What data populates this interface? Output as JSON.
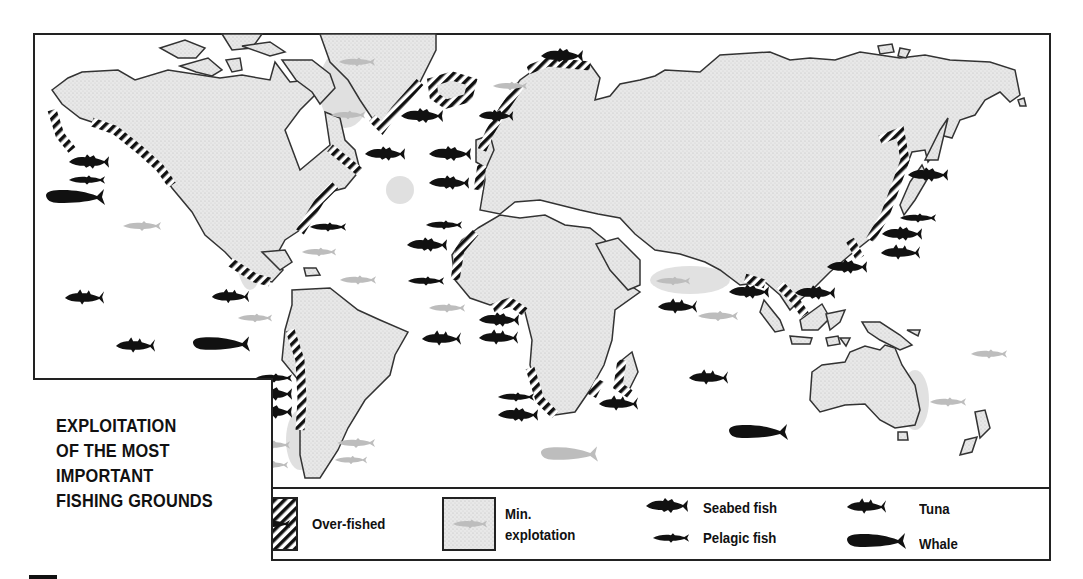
{
  "title": {
    "lines": [
      "EXPLOITATION",
      "OF THE MOST",
      "IMPORTANT",
      "FISHING GROUNDS"
    ]
  },
  "legend": {
    "overfished": {
      "label": "Over-fished",
      "pattern": "diagonal-hatch",
      "color": "#111111"
    },
    "min_exploitation": {
      "label_line1": "Min.",
      "label_line2": "explotation",
      "fill": "#e2e2e2"
    },
    "seabed_fish": {
      "label": "Seabed fish",
      "icon": "seabed-fish-icon"
    },
    "pelagic_fish": {
      "label": "Pelagic fish",
      "icon": "pelagic-fish-icon"
    },
    "tuna": {
      "label": "Tuna",
      "icon": "tuna-icon"
    },
    "whale": {
      "label": "Whale",
      "icon": "whale-icon"
    }
  },
  "colors": {
    "land": "#e6e6e6",
    "outline": "#333333",
    "overfished_hatch": "#111111",
    "exploited_fish": "#111111",
    "min_exploited_fish": "#bdbdbd",
    "min_zone_halo": "#d6d6d6"
  },
  "markers": [
    {
      "type": "seabed",
      "x": 540,
      "y": 56,
      "w": 44,
      "state": "exploited"
    },
    {
      "type": "pelagic",
      "x": 338,
      "y": 62,
      "w": 38,
      "state": "min"
    },
    {
      "type": "pelagic",
      "x": 330,
      "y": 115,
      "w": 36,
      "state": "min"
    },
    {
      "type": "seabed",
      "x": 400,
      "y": 116,
      "w": 44,
      "state": "exploited"
    },
    {
      "type": "pelagic",
      "x": 492,
      "y": 86,
      "w": 36,
      "state": "min"
    },
    {
      "type": "seabed",
      "x": 478,
      "y": 116,
      "w": 36,
      "state": "exploited"
    },
    {
      "type": "seabed",
      "x": 68,
      "y": 162,
      "w": 42,
      "state": "exploited"
    },
    {
      "type": "pelagic",
      "x": 68,
      "y": 180,
      "w": 38,
      "state": "exploited"
    },
    {
      "type": "whale",
      "x": 45,
      "y": 197,
      "w": 62,
      "state": "exploited"
    },
    {
      "type": "seabed",
      "x": 364,
      "y": 154,
      "w": 42,
      "state": "exploited"
    },
    {
      "type": "seabed",
      "x": 428,
      "y": 154,
      "w": 44,
      "state": "exploited"
    },
    {
      "type": "seabed",
      "x": 428,
      "y": 183,
      "w": 42,
      "state": "exploited"
    },
    {
      "type": "pelagic",
      "x": 122,
      "y": 226,
      "w": 40,
      "state": "min"
    },
    {
      "type": "pelagic",
      "x": 309,
      "y": 227,
      "w": 38,
      "state": "exploited"
    },
    {
      "type": "pelagic",
      "x": 425,
      "y": 225,
      "w": 38,
      "state": "exploited"
    },
    {
      "type": "seabed",
      "x": 406,
      "y": 245,
      "w": 42,
      "state": "exploited"
    },
    {
      "type": "pelagic",
      "x": 301,
      "y": 252,
      "w": 36,
      "state": "min"
    },
    {
      "type": "pelagic",
      "x": 339,
      "y": 280,
      "w": 38,
      "state": "min"
    },
    {
      "type": "pelagic",
      "x": 407,
      "y": 281,
      "w": 38,
      "state": "exploited"
    },
    {
      "type": "pelagic",
      "x": 428,
      "y": 308,
      "w": 38,
      "state": "min"
    },
    {
      "type": "tuna",
      "x": 64,
      "y": 297,
      "w": 42,
      "state": "exploited"
    },
    {
      "type": "tuna",
      "x": 211,
      "y": 296,
      "w": 40,
      "state": "exploited"
    },
    {
      "type": "pelagic",
      "x": 237,
      "y": 318,
      "w": 36,
      "state": "min"
    },
    {
      "type": "tuna",
      "x": 115,
      "y": 345,
      "w": 42,
      "state": "exploited"
    },
    {
      "type": "whale",
      "x": 192,
      "y": 344,
      "w": 60,
      "state": "exploited"
    },
    {
      "type": "seabed",
      "x": 478,
      "y": 320,
      "w": 42,
      "state": "exploited"
    },
    {
      "type": "tuna",
      "x": 478,
      "y": 337,
      "w": 42,
      "state": "exploited"
    },
    {
      "type": "tuna",
      "x": 421,
      "y": 338,
      "w": 42,
      "state": "exploited"
    },
    {
      "type": "pelagic",
      "x": 255,
      "y": 378,
      "w": 38,
      "state": "exploited"
    },
    {
      "type": "seabed",
      "x": 251,
      "y": 394,
      "w": 42,
      "state": "exploited"
    },
    {
      "type": "seabed",
      "x": 251,
      "y": 412,
      "w": 42,
      "state": "exploited"
    },
    {
      "type": "pelagic",
      "x": 253,
      "y": 445,
      "w": 38,
      "state": "min"
    },
    {
      "type": "pelagic",
      "x": 255,
      "y": 465,
      "w": 34,
      "state": "min"
    },
    {
      "type": "pelagic",
      "x": 336,
      "y": 443,
      "w": 40,
      "state": "min"
    },
    {
      "type": "pelagic",
      "x": 334,
      "y": 460,
      "w": 34,
      "state": "min"
    },
    {
      "type": "pelagic",
      "x": 497,
      "y": 397,
      "w": 38,
      "state": "exploited"
    },
    {
      "type": "seabed",
      "x": 497,
      "y": 415,
      "w": 42,
      "state": "exploited"
    },
    {
      "type": "tuna",
      "x": 598,
      "y": 403,
      "w": 42,
      "state": "exploited"
    },
    {
      "type": "whale",
      "x": 540,
      "y": 454,
      "w": 60,
      "state": "min"
    },
    {
      "type": "pelagic",
      "x": 655,
      "y": 281,
      "w": 36,
      "state": "min"
    },
    {
      "type": "tuna",
      "x": 657,
      "y": 306,
      "w": 42,
      "state": "exploited"
    },
    {
      "type": "pelagic",
      "x": 697,
      "y": 316,
      "w": 42,
      "state": "min"
    },
    {
      "type": "seabed",
      "x": 728,
      "y": 292,
      "w": 42,
      "state": "exploited"
    },
    {
      "type": "seabed",
      "x": 794,
      "y": 293,
      "w": 42,
      "state": "exploited"
    },
    {
      "type": "tuna",
      "x": 688,
      "y": 377,
      "w": 42,
      "state": "exploited"
    },
    {
      "type": "whale",
      "x": 728,
      "y": 432,
      "w": 62,
      "state": "exploited"
    },
    {
      "type": "seabed",
      "x": 907,
      "y": 175,
      "w": 42,
      "state": "exploited"
    },
    {
      "type": "pelagic",
      "x": 899,
      "y": 218,
      "w": 38,
      "state": "exploited"
    },
    {
      "type": "seabed",
      "x": 881,
      "y": 234,
      "w": 42,
      "state": "exploited"
    },
    {
      "type": "tuna",
      "x": 880,
      "y": 252,
      "w": 42,
      "state": "exploited"
    },
    {
      "type": "seabed",
      "x": 826,
      "y": 267,
      "w": 42,
      "state": "exploited"
    },
    {
      "type": "pelagic",
      "x": 970,
      "y": 354,
      "w": 38,
      "state": "min"
    },
    {
      "type": "pelagic",
      "x": 929,
      "y": 402,
      "w": 38,
      "state": "min"
    }
  ]
}
